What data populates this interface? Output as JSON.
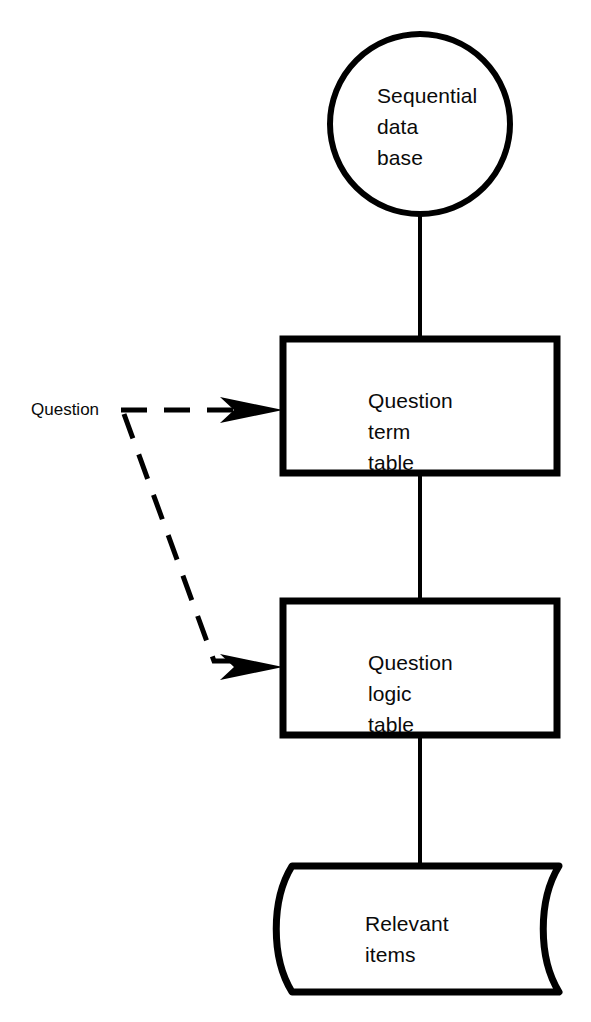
{
  "diagram": {
    "type": "flowchart",
    "background_color": "#ffffff",
    "stroke_color": "#000000",
    "text_color": "#0a0a0a",
    "nodes": [
      {
        "id": "sequential-data-base",
        "shape": "circle",
        "label": "Sequential\ndata\nbase",
        "lines": [
          "Sequential",
          "data",
          "base"
        ]
      },
      {
        "id": "question-term-table",
        "shape": "rectangle",
        "label": "Question\nterm\ntable",
        "lines": [
          "Question",
          "term",
          "table"
        ]
      },
      {
        "id": "question-logic-table",
        "shape": "rectangle",
        "label": "Question\nlogic\ntable",
        "lines": [
          "Question",
          "logic",
          "table"
        ]
      },
      {
        "id": "relevant-items",
        "shape": "stored-data-tape",
        "label": "Relevant\nitems",
        "lines": [
          "Relevant",
          "items"
        ]
      }
    ],
    "edges": [
      {
        "id": "edge-db-to-term",
        "from": "sequential-data-base",
        "to": "question-term-table",
        "style": "solid",
        "arrow": false
      },
      {
        "id": "edge-term-to-logic",
        "from": "question-term-table",
        "to": "question-logic-table",
        "style": "solid",
        "arrow": false
      },
      {
        "id": "edge-logic-to-items",
        "from": "question-logic-table",
        "to": "relevant-items",
        "style": "solid",
        "arrow": false
      },
      {
        "id": "edge-question-to-term",
        "from": "question-input",
        "to": "question-term-table",
        "style": "dashed",
        "arrow": true,
        "label": "Question"
      },
      {
        "id": "edge-question-to-logic",
        "from": "question-input",
        "to": "question-logic-table",
        "style": "dashed",
        "arrow": true,
        "label": "Question"
      }
    ],
    "labels": {
      "question_input": "Question"
    }
  }
}
